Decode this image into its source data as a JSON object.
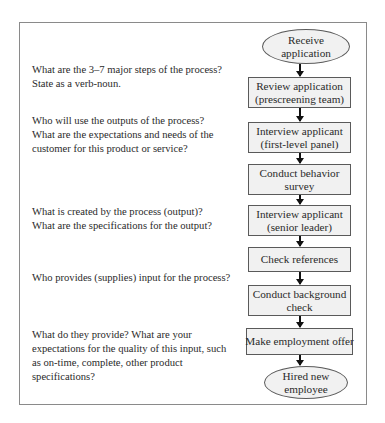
{
  "questions": [
    {
      "lines": [
        "What are the 3–7 major steps of the process?",
        "State as a verb-noun."
      ]
    },
    {
      "lines": [
        "Who will use the outputs of the process?",
        "What are the expectations and needs of the",
        "customer for this product or service?"
      ]
    },
    {
      "lines": [
        "What is created by the process (output)?",
        "What are the specifications for the output?"
      ]
    },
    {
      "lines": [
        "Who provides (supplies) input for the process?"
      ]
    },
    {
      "lines": [
        "What do they provide? What are your",
        "expectations for the quality of this input, such",
        "as on-time, complete, other product",
        "specifications?"
      ]
    }
  ],
  "flowchart": {
    "start": {
      "shape": "ellipse",
      "lines": [
        "Receive",
        "application"
      ]
    },
    "steps": [
      {
        "shape": "rect",
        "lines": [
          "Review application",
          "(prescreening team)"
        ]
      },
      {
        "shape": "rect",
        "lines": [
          "Interview applicant",
          "(first-level panel)"
        ]
      },
      {
        "shape": "rect",
        "lines": [
          "Conduct behavior",
          "survey"
        ]
      },
      {
        "shape": "rect",
        "lines": [
          "Interview applicant",
          "(senior leader)"
        ]
      },
      {
        "shape": "rect",
        "lines": [
          "Check references"
        ]
      },
      {
        "shape": "rect",
        "lines": [
          "Conduct background",
          "check"
        ]
      },
      {
        "shape": "rect",
        "lines": [
          "Make employment offer"
        ]
      }
    ],
    "end": {
      "shape": "ellipse",
      "lines": [
        "Hired new",
        "employee"
      ]
    }
  },
  "colors": {
    "node_fill": "#f1f1f1",
    "node_border": "#5a5a5a",
    "arrow": "#111111",
    "frame_border": "#8a8a8a",
    "text": "#2a2a2a"
  }
}
